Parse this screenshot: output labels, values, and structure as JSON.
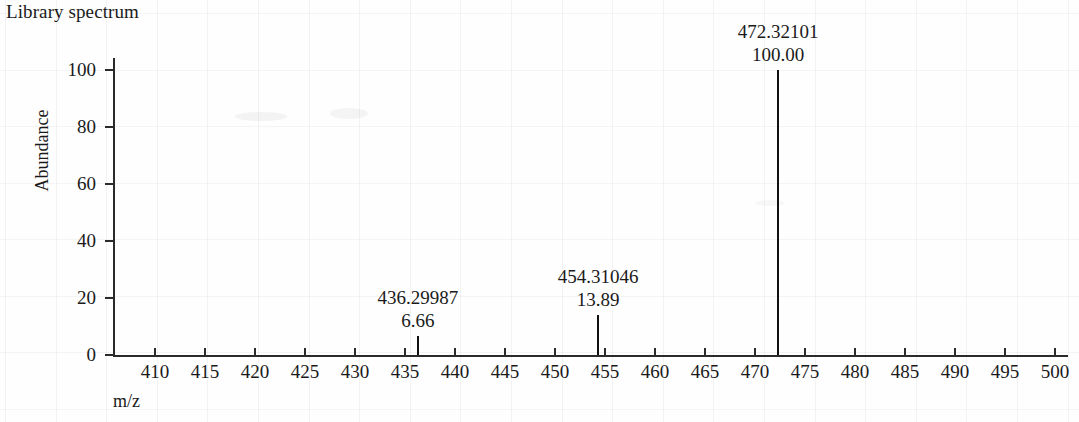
{
  "title": "Library spectrum",
  "axes": {
    "ylabel": "Abundance",
    "xlabel": "m/z",
    "yticks": [
      "0",
      "20",
      "40",
      "60",
      "80",
      "100"
    ],
    "xticks": [
      "410",
      "415",
      "420",
      "425",
      "430",
      "435",
      "440",
      "445",
      "450",
      "455",
      "460",
      "465",
      "470",
      "475",
      "480",
      "485",
      "490",
      "495",
      "500"
    ]
  },
  "peaks": [
    {
      "mz": "436.29987",
      "intensity": "6.66"
    },
    {
      "mz": "454.31046",
      "intensity": "13.89"
    },
    {
      "mz": "472.32101",
      "intensity": "100.00"
    }
  ],
  "colors": {
    "axis": "#2a2a2a",
    "peak": "#111111",
    "text": "#1a1a1a",
    "grid": "rgba(120,125,140,0.08)"
  },
  "chart_data": {
    "type": "bar",
    "title": "Library spectrum",
    "xlabel": "m/z",
    "ylabel": "Abundance",
    "xlim": [
      406,
      502
    ],
    "ylim": [
      0,
      106
    ],
    "grid": true,
    "legend": null,
    "x": [
      436.29987,
      454.31046,
      472.32101
    ],
    "values": [
      6.66,
      13.89,
      100.0
    ],
    "xticks": [
      410,
      415,
      420,
      425,
      430,
      435,
      440,
      445,
      450,
      455,
      460,
      465,
      470,
      475,
      480,
      485,
      490,
      495,
      500
    ],
    "yticks": [
      0,
      20,
      40,
      60,
      80,
      100
    ],
    "annotations": [
      {
        "x": 436.29987,
        "y": 6.66,
        "text": "436.29987\n6.66"
      },
      {
        "x": 454.31046,
        "y": 13.89,
        "text": "454.31046\n13.89"
      },
      {
        "x": 472.32101,
        "y": 100.0,
        "text": "472.32101\n100.00"
      }
    ]
  }
}
